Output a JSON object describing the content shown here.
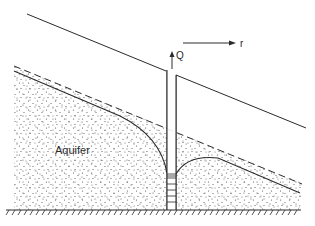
{
  "diagram": {
    "labels": {
      "aquifer": "Aquifer",
      "discharge": "Q",
      "radial_direction": "r"
    },
    "elements": [
      {
        "name": "ground-surface",
        "style": "solid"
      },
      {
        "name": "original-water-table",
        "style": "dashed"
      },
      {
        "name": "drawdown-curve-left",
        "style": "solid"
      },
      {
        "name": "drawdown-curve-right",
        "style": "solid"
      },
      {
        "name": "well-casing",
        "style": "solid"
      },
      {
        "name": "well-screen",
        "style": "ladder"
      },
      {
        "name": "impermeable-base",
        "style": "hatched"
      },
      {
        "name": "discharge-arrow",
        "direction": "up"
      },
      {
        "name": "radial-arrow",
        "direction": "right"
      }
    ],
    "colors": {
      "line": "#2a2a2a",
      "background": "#ffffff",
      "sand_dots": "#555555"
    }
  }
}
